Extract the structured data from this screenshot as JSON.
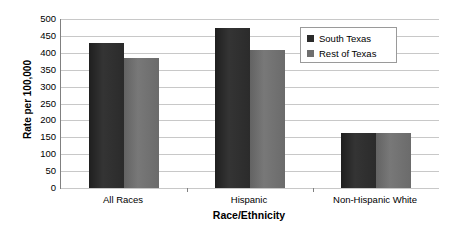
{
  "chart_data": {
    "type": "bar",
    "title": "",
    "xlabel": "Race/Ethnicity",
    "ylabel": "Rate per 100,000",
    "categories": [
      "All Races",
      "Hispanic",
      "Non-Hispanic White"
    ],
    "series": [
      {
        "name": "South Texas",
        "color": "#2b2b2b",
        "values": [
          428,
          473,
          163
        ]
      },
      {
        "name": "Rest of Texas",
        "color": "#6f6f6f",
        "values": [
          385,
          408,
          164
        ]
      }
    ],
    "ylim": [
      0,
      500
    ],
    "ytick_step": 50,
    "yticks": [
      "500",
      "450",
      "400",
      "350",
      "300",
      "250",
      "200",
      "150",
      "100",
      "50",
      "0"
    ],
    "ytick_values": [
      500,
      450,
      400,
      350,
      300,
      250,
      200,
      150,
      100,
      50,
      0
    ],
    "grid": true,
    "legend_position": "upper-center-right",
    "axis_color": "#808080",
    "grid_color": "#c8c8c8",
    "background": "#ffffff"
  },
  "legend": {
    "items": [
      {
        "label": "South Texas"
      },
      {
        "label": "Rest of Texas"
      }
    ]
  }
}
